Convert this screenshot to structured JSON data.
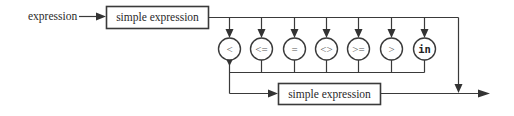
{
  "diagram": {
    "type": "syntax-diagram",
    "entry_label": "expression",
    "first_box": "simple expression",
    "operators": [
      "<",
      "<=",
      "=",
      "<>",
      ">=",
      ">",
      "in"
    ],
    "second_box": "simple expression",
    "colors": {
      "stroke": "#3a3a3a",
      "background": "#ffffff"
    }
  }
}
